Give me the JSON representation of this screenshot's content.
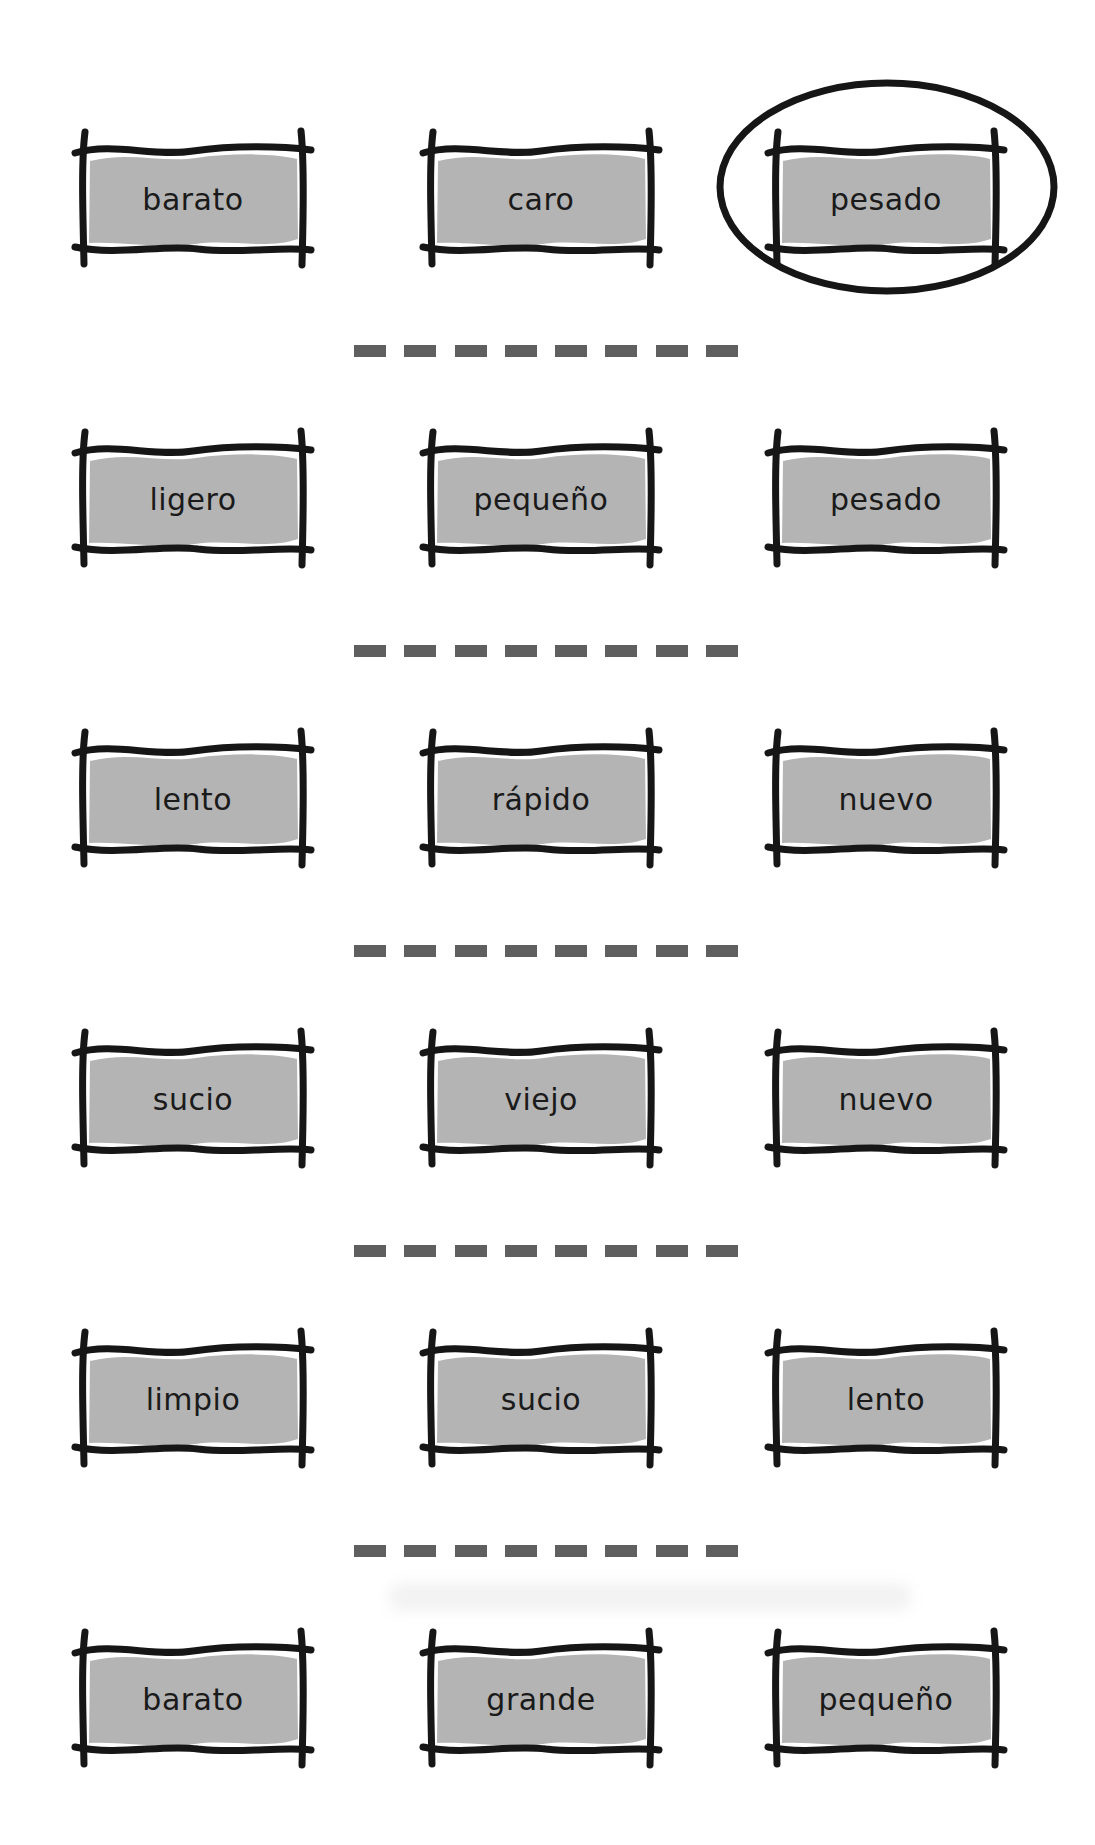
{
  "style": {
    "page_background": "#ffffff",
    "card_fill": "#b4b4b4",
    "border_color": "#161616",
    "dash_color": "#5f5f5f",
    "text_color": "#1a1a1a"
  },
  "worksheet": {
    "rows": [
      {
        "cards": [
          {
            "label": "barato"
          },
          {
            "label": "caro"
          },
          {
            "label": "pesado",
            "circled": true
          }
        ]
      },
      {
        "cards": [
          {
            "label": "ligero"
          },
          {
            "label": "pequeño"
          },
          {
            "label": "pesado"
          }
        ]
      },
      {
        "cards": [
          {
            "label": "lento"
          },
          {
            "label": "rápido"
          },
          {
            "label": "nuevo"
          }
        ]
      },
      {
        "cards": [
          {
            "label": "sucio"
          },
          {
            "label": "viejo"
          },
          {
            "label": "nuevo"
          }
        ]
      },
      {
        "cards": [
          {
            "label": "limpio"
          },
          {
            "label": "sucio"
          },
          {
            "label": "lento"
          }
        ]
      },
      {
        "cards": [
          {
            "label": "barato"
          },
          {
            "label": "grande"
          },
          {
            "label": "pequeño"
          }
        ]
      }
    ],
    "separator_dash_count": 8,
    "circled_answer": "pesado"
  }
}
